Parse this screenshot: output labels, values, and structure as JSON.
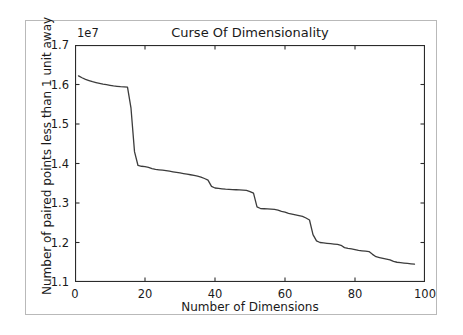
{
  "figure": {
    "background_color": "#ffffff",
    "border_color": "#b9b9b9"
  },
  "chart_data": {
    "type": "line",
    "title": "Curse Of Dimensionality",
    "xlabel": "Number of Dimensions",
    "ylabel": "Number of paired points less than 1 unit away",
    "y_offset_text": "1e7",
    "y_offset_multiplier": 10000000,
    "xlim": [
      0,
      100
    ],
    "ylim": [
      11000000,
      17000000
    ],
    "xticks": [
      0,
      20,
      40,
      60,
      80,
      100
    ],
    "xtick_labels": [
      "0",
      "20",
      "40",
      "60",
      "80",
      "100"
    ],
    "yticks": [
      11000000,
      12000000,
      13000000,
      14000000,
      15000000,
      16000000,
      17000000
    ],
    "ytick_labels": [
      "1.1",
      "1.2",
      "1.3",
      "1.4",
      "1.5",
      "1.6",
      "1.7"
    ],
    "grid": false,
    "legend": null,
    "line_color": "#3c3c3c",
    "line_width": 1.3,
    "series": [
      {
        "name": "paired points within 1 unit",
        "x": [
          1,
          2,
          3,
          4,
          5,
          6,
          7,
          8,
          9,
          10,
          11,
          12,
          13,
          14,
          15,
          16,
          17,
          18,
          19,
          20,
          21,
          22,
          23,
          24,
          25,
          26,
          27,
          28,
          29,
          30,
          31,
          32,
          33,
          34,
          35,
          36,
          37,
          38,
          39,
          40,
          41,
          42,
          43,
          44,
          45,
          46,
          47,
          48,
          49,
          50,
          51,
          52,
          53,
          54,
          55,
          56,
          57,
          58,
          59,
          60,
          61,
          62,
          63,
          64,
          65,
          66,
          67,
          68,
          69,
          70,
          71,
          72,
          73,
          74,
          75,
          76,
          77,
          78,
          79,
          80,
          81,
          82,
          83,
          84,
          85,
          86,
          87,
          88,
          89,
          90,
          91,
          92,
          93,
          94,
          95,
          96,
          97
        ],
        "y": [
          16220000,
          16170000,
          16130000,
          16100000,
          16070000,
          16050000,
          16030000,
          16010000,
          15995000,
          15980000,
          15965000,
          15955000,
          15945000,
          15940000,
          15935000,
          15400000,
          14300000,
          13950000,
          13930000,
          13920000,
          13900000,
          13870000,
          13850000,
          13840000,
          13830000,
          13820000,
          13805000,
          13790000,
          13775000,
          13760000,
          13745000,
          13730000,
          13715000,
          13700000,
          13680000,
          13655000,
          13620000,
          13580000,
          13420000,
          13380000,
          13370000,
          13360000,
          13350000,
          13345000,
          13340000,
          13335000,
          13330000,
          13325000,
          13320000,
          13290000,
          13250000,
          12900000,
          12860000,
          12855000,
          12850000,
          12845000,
          12840000,
          12820000,
          12790000,
          12770000,
          12740000,
          12720000,
          12700000,
          12680000,
          12660000,
          12620000,
          12570000,
          12200000,
          12040000,
          12000000,
          11990000,
          11980000,
          11970000,
          11960000,
          11950000,
          11930000,
          11870000,
          11850000,
          11840000,
          11820000,
          11800000,
          11790000,
          11780000,
          11770000,
          11700000,
          11640000,
          11620000,
          11600000,
          11580000,
          11560000,
          11520000,
          11500000,
          11490000,
          11480000,
          11470000,
          11460000,
          11450000
        ]
      }
    ]
  }
}
